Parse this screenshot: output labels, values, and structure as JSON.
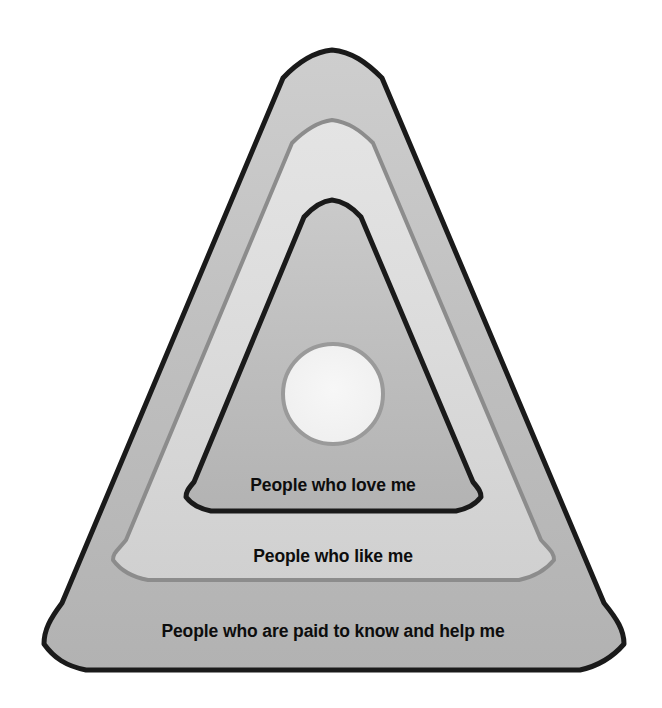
{
  "diagram": {
    "type": "concentric-rounded-triangle",
    "title": "",
    "background_color": "#ffffff",
    "center": {
      "x": 333,
      "y": 394
    },
    "rings": [
      {
        "id": "outer",
        "name": "paid-professionals-ring",
        "label": "People who are paid to know and help me",
        "label_x": 333,
        "label_y": 632,
        "fill_top_color": "#cacaca",
        "fill_bottom_color": "#b3b3b3",
        "stroke_color": "#1a1a1a",
        "stroke_width": 5,
        "apex": {
          "x": 332,
          "y": 50
        },
        "bottom_left": {
          "x": 44,
          "y": 644
        },
        "bottom_right": {
          "x": 624,
          "y": 644
        },
        "bottom_bulge_y": 676
      },
      {
        "id": "middle",
        "name": "people-who-like-me-ring",
        "label": "People who like me",
        "label_x": 333,
        "label_y": 557,
        "fill_top_color": "#e0e0e0",
        "fill_bottom_color": "#d2d2d2",
        "stroke_color": "#8c8c8c",
        "stroke_width": 4,
        "apex": {
          "x": 332,
          "y": 120
        },
        "bottom_left": {
          "x": 113,
          "y": 560
        },
        "bottom_right": {
          "x": 554,
          "y": 560
        },
        "bottom_bulge_y": 588
      },
      {
        "id": "inner",
        "name": "people-who-love-me-ring",
        "label": "People who love me",
        "label_x": 333,
        "label_y": 486,
        "fill_top_color": "#c6c6c6",
        "fill_bottom_color": "#b6b6b6",
        "stroke_color": "#1a1a1a",
        "stroke_width": 5,
        "apex": {
          "x": 332,
          "y": 200
        },
        "bottom_left": {
          "x": 186,
          "y": 497
        },
        "bottom_right": {
          "x": 481,
          "y": 497
        },
        "bottom_bulge_y": 517
      }
    ],
    "center_circle": {
      "id": "core",
      "name": "self-core-circle",
      "label": "",
      "cx": 333,
      "cy": 394,
      "r": 50,
      "fill_color": "#f3f3f3",
      "stroke_color": "#9a9a9a",
      "stroke_width": 4
    }
  }
}
